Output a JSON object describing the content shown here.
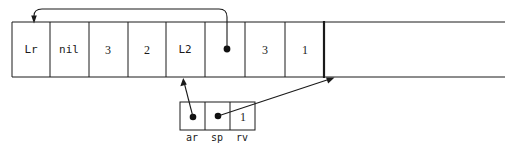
{
  "diagram": {
    "colors": {
      "stroke": "#1a1a1a",
      "background": "#ffffff",
      "dot": "#111111"
    },
    "stack": {
      "name": "stack-frame-row",
      "cells": [
        {
          "id": "cell-lr",
          "label": "Lr",
          "kind": "text"
        },
        {
          "id": "cell-nil",
          "label": "nil",
          "kind": "text"
        },
        {
          "id": "cell-3a",
          "label": "3",
          "kind": "number"
        },
        {
          "id": "cell-2",
          "label": "2",
          "kind": "number"
        },
        {
          "id": "cell-l2",
          "label": "L2",
          "kind": "text"
        },
        {
          "id": "cell-ptr",
          "label": "",
          "kind": "pointer"
        },
        {
          "id": "cell-3b",
          "label": "3",
          "kind": "number"
        },
        {
          "id": "cell-1",
          "label": "1",
          "kind": "number"
        }
      ],
      "tail_label": ""
    },
    "record": {
      "name": "activation-record-row",
      "cells": [
        {
          "id": "rec-ar",
          "label": "",
          "kind": "pointer",
          "field": "ar"
        },
        {
          "id": "rec-sp",
          "label": "",
          "kind": "pointer",
          "field": "sp"
        },
        {
          "id": "rec-rv",
          "label": "1",
          "kind": "number",
          "field": "rv"
        }
      ],
      "field_labels": [
        "ar",
        "sp",
        "rv"
      ]
    },
    "arrows": [
      {
        "id": "arrow-ptr-to-start",
        "from": "cell-ptr",
        "to": "cell-lr-top"
      },
      {
        "id": "arrow-ar-to-l2",
        "from": "rec-ar",
        "to": "cell-l2-bottom"
      },
      {
        "id": "arrow-sp-to-stacktop",
        "from": "rec-sp",
        "to": "stack-boundary"
      }
    ]
  }
}
